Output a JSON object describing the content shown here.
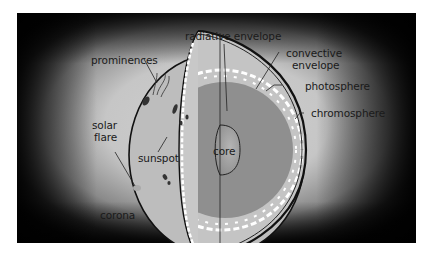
{
  "diagram": {
    "labels": {
      "radiative_envelope": "radiative envelope",
      "convective_envelope_line1": "convective",
      "convective_envelope_line2": "envelope",
      "photosphere": "photosphere",
      "chromosphere": "chromosphere",
      "prominences": "prominences",
      "solar_flare_line1": "solar",
      "solar_flare_line2": "flare",
      "sunspot": "sunspot",
      "core": "core",
      "corona": "corona"
    },
    "colors": {
      "background_edge": "#0d0d0d",
      "corona_glow": "#c9c9c9",
      "sun_surface": "#bdbdbd",
      "convective_zone": "#c4c4c4",
      "radiative_zone": "#8f8f8f",
      "core": "#9a9a9a",
      "outline": "#111111",
      "convection_cells": "#ffffff"
    }
  }
}
